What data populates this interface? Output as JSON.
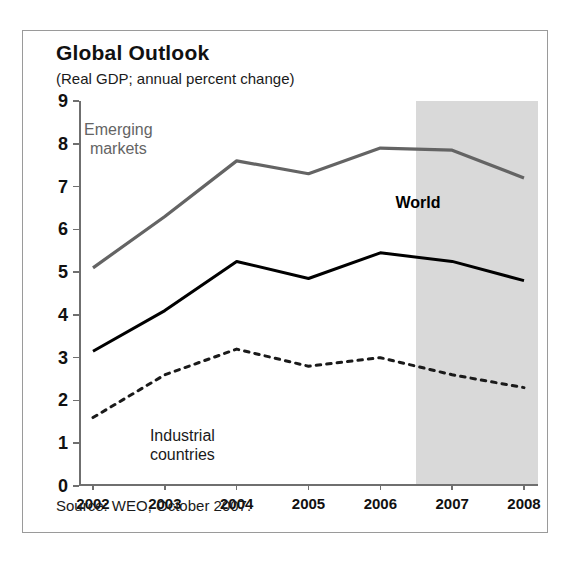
{
  "figure": {
    "title": "Global Outlook",
    "subtitle": "(Real GDP; annual percent change)",
    "source": "Source: WEO, October 2007."
  },
  "labels": {
    "emerging_line1": "Emerging",
    "emerging_line2": "markets",
    "world": "World",
    "industrial_line1": "Industrial",
    "industrial_line2": "countries"
  },
  "colors": {
    "emerging": "#646464",
    "world": "#000000",
    "industrial": "#1a1a1a",
    "forecast_shade": "#d9d9d9",
    "axis": "#6f6f6f",
    "border": "#9a9a9a"
  },
  "chart_data": {
    "type": "line",
    "title": "Global Outlook",
    "subtitle": "(Real GDP; annual percent change)",
    "xlabel": "",
    "ylabel": "",
    "x": [
      2002,
      2003,
      2004,
      2005,
      2006,
      2007,
      2008
    ],
    "xticklabels": [
      "2002",
      "2003",
      "2004",
      "2005",
      "2006",
      "2007",
      "2008"
    ],
    "yticks": [
      0,
      1,
      2,
      3,
      4,
      5,
      6,
      7,
      8,
      9
    ],
    "yticklabels": [
      "0",
      "1",
      "2",
      "3",
      "4",
      "5",
      "6",
      "7",
      "8",
      "9"
    ],
    "ylim": [
      0,
      9
    ],
    "xlim": [
      2002,
      2008
    ],
    "grid": false,
    "legend": "inline-annotations",
    "series": [
      {
        "name": "Emerging markets",
        "style": "solid",
        "color": "#646464",
        "width": 3.2,
        "values": [
          5.1,
          6.3,
          7.6,
          7.3,
          7.9,
          7.85,
          7.2
        ]
      },
      {
        "name": "World",
        "style": "solid",
        "color": "#000000",
        "width": 3.0,
        "values": [
          3.15,
          4.1,
          5.25,
          4.85,
          5.45,
          5.25,
          4.8
        ]
      },
      {
        "name": "Industrial countries",
        "style": "dotted",
        "color": "#1a1a1a",
        "width": 3.0,
        "values": [
          1.6,
          2.6,
          3.2,
          2.8,
          3.0,
          2.6,
          2.3
        ]
      }
    ],
    "annotations": [
      {
        "text": "Emerging markets",
        "x": 2002.6,
        "y": 8.3
      },
      {
        "text": "World",
        "x": 2006.6,
        "y": 6.6
      },
      {
        "text": "Industrial countries",
        "x": 2003.6,
        "y": 1.15
      }
    ],
    "shaded_region": {
      "label": "forecast",
      "x_start": 2006.5,
      "x_end": 2008,
      "color": "#d9d9d9"
    },
    "source": "Source: WEO, October 2007."
  }
}
